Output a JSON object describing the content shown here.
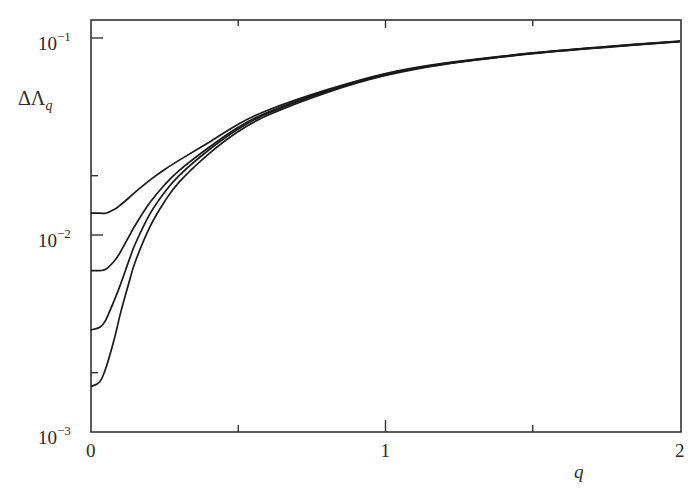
{
  "chart_data": {
    "type": "line",
    "title": "",
    "xlabel": "q",
    "ylabel": "ΔΛ_q",
    "ylabel_main": "ΔΛ",
    "ylabel_sub": "q",
    "xscale": "linear",
    "yscale": "log",
    "xlim": [
      0,
      2
    ],
    "ylim": [
      0.001,
      0.13
    ],
    "grid": false,
    "legend": null,
    "x_ticks": [
      {
        "value": 0,
        "label": "0"
      },
      {
        "value": 1,
        "label": "1"
      },
      {
        "value": 2,
        "label": "2"
      }
    ],
    "x_minor_ticks": [
      0.5,
      1.5
    ],
    "y_ticks": [
      {
        "value": 0.1,
        "base": "10",
        "exp": "−1"
      },
      {
        "value": 0.01,
        "base": "10",
        "exp": "−2"
      },
      {
        "value": 0.001,
        "base": "10",
        "exp": "−3"
      }
    ],
    "y_minor_ticks": [
      0.02,
      0.002
    ],
    "x": [
      0,
      0.03,
      0.05,
      0.08,
      0.1,
      0.13,
      0.15,
      0.2,
      0.25,
      0.3,
      0.4,
      0.5,
      0.6,
      0.8,
      1.0,
      1.2,
      1.5,
      1.75,
      2.0
    ],
    "series": [
      {
        "name": "curve-1",
        "values": [
          0.0129,
          0.0129,
          0.0129,
          0.0135,
          0.0142,
          0.0155,
          0.0165,
          0.019,
          0.0215,
          0.024,
          0.0295,
          0.0365,
          0.043,
          0.0545,
          0.066,
          0.0745,
          0.084,
          0.0905,
          0.0965
        ]
      },
      {
        "name": "curve-2",
        "values": [
          0.0066,
          0.0066,
          0.0067,
          0.0074,
          0.0082,
          0.0099,
          0.0112,
          0.0146,
          0.018,
          0.0213,
          0.0278,
          0.0352,
          0.042,
          0.054,
          0.0655,
          0.0742,
          0.0838,
          0.0903,
          0.0963
        ]
      },
      {
        "name": "curve-3",
        "values": [
          0.0033,
          0.0034,
          0.0037,
          0.0047,
          0.0056,
          0.0075,
          0.009,
          0.0128,
          0.0165,
          0.0201,
          0.027,
          0.0345,
          0.0414,
          0.0535,
          0.065,
          0.0738,
          0.0835,
          0.09,
          0.096
        ]
      },
      {
        "name": "curve-4",
        "values": [
          0.0017,
          0.0018,
          0.0021,
          0.003,
          0.004,
          0.0058,
          0.0073,
          0.011,
          0.0148,
          0.0186,
          0.0258,
          0.0335,
          0.0405,
          0.0528,
          0.0645,
          0.0735,
          0.0832,
          0.0897,
          0.0958
        ]
      }
    ],
    "colors": {
      "line": "#1a1a1a",
      "axis": "#333333",
      "text": "#2a2a2a",
      "background": "#ffffff"
    }
  }
}
